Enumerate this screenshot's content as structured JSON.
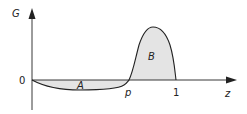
{
  "diagram": {
    "y_axis_label": "G",
    "x_axis_label": "z",
    "origin_label": "0",
    "tick_p_label": "p",
    "tick_1_label": "1",
    "region_a_label": "A",
    "region_b_label": "B",
    "fill_color": "#e4e4e4",
    "line_color": "#222222"
  }
}
